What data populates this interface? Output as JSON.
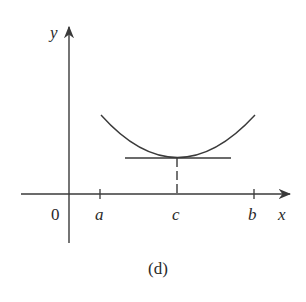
{
  "figure": {
    "caption": "(d)",
    "colors": {
      "ink": "#3a3a3a",
      "background": "#ffffff"
    }
  },
  "axes": {
    "x_label": "x",
    "y_label": "y",
    "origin_label": "0"
  },
  "ticks": {
    "a": "a",
    "b": "b",
    "c": "c"
  },
  "curve": {
    "description": "U-shaped curve with minimum at x = c, horizontal tangent line at minimum, dashed line dropping to c"
  }
}
